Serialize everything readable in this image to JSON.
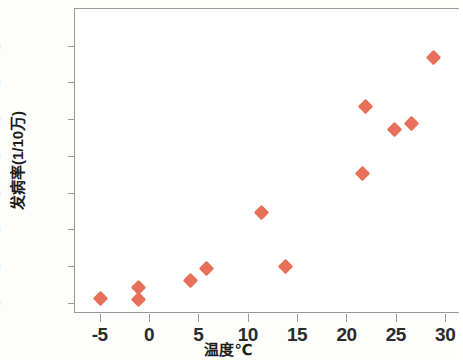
{
  "chart_data": {
    "type": "scatter",
    "title": "",
    "xlabel": "温度℃",
    "ylabel": "发病率(1/10万)",
    "xlim": [
      -7.5,
      31.5
    ],
    "ylim": [
      -3,
      80
    ],
    "grid": false,
    "legend": null,
    "marker": {
      "shape": "diamond",
      "color": "#e8705a",
      "size": 11
    },
    "axis_color": "#9a9a9a",
    "xticks": [
      -5,
      0,
      5,
      10,
      15,
      20,
      25,
      30
    ],
    "xtick_labels": [
      "-5",
      "0",
      "5",
      "10",
      "15",
      "20",
      "25",
      "30"
    ],
    "yticks": [
      0,
      10,
      20,
      30,
      40,
      50,
      60,
      70
    ],
    "ytick_labels": [
      "0",
      "10",
      "20",
      "30",
      "40",
      "50",
      "60",
      "70"
    ],
    "points": [
      {
        "x": -4.9,
        "y": 1.1
      },
      {
        "x": -1.1,
        "y": 4.3
      },
      {
        "x": -1.1,
        "y": 1.0
      },
      {
        "x": 4.2,
        "y": 6.2
      },
      {
        "x": 5.8,
        "y": 9.3
      },
      {
        "x": 11.4,
        "y": 24.6
      },
      {
        "x": 13.8,
        "y": 10.0
      },
      {
        "x": 21.6,
        "y": 35.1
      },
      {
        "x": 21.9,
        "y": 53.4
      },
      {
        "x": 24.9,
        "y": 47.3
      },
      {
        "x": 26.6,
        "y": 48.9
      },
      {
        "x": 28.8,
        "y": 66.7
      }
    ]
  }
}
